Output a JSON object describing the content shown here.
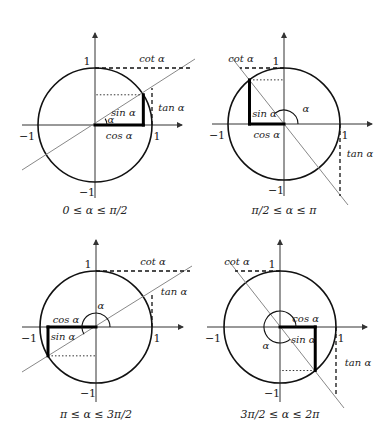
{
  "figure": {
    "labels": {
      "sin": "sin α",
      "cos": "cos α",
      "tan": "tan α",
      "cot": "cot α",
      "alpha": "α",
      "one": "1",
      "minus_one": "−1"
    },
    "panels": [
      {
        "id": "q1",
        "caption": "0 ≤ α ≤ π/2",
        "center": [
          95,
          125
        ],
        "radius": 57,
        "alpha_deg": 32,
        "arc_radius": 12,
        "axis": {
          "x_min": 22,
          "x_max": 182,
          "y_min": 33,
          "y_max": 198
        },
        "ray": [
          [
            22,
            170
          ],
          [
            195,
            59
          ]
        ],
        "cot_line": {
          "y": 68,
          "x_to": 190
        },
        "tan_line": {
          "x": 152,
          "y_to": 88
        },
        "caption_pos": [
          95,
          214
        ]
      },
      {
        "id": "q2",
        "caption": "π/2 ≤ α ≤ π",
        "center": [
          284,
          124
        ],
        "radius": 56,
        "alpha_deg": 128,
        "arc_radius": 14,
        "axis": {
          "x_min": 212,
          "x_max": 372,
          "y_min": 33,
          "y_max": 196
        },
        "ray": [
          [
            232,
            58
          ],
          [
            348,
            205
          ]
        ],
        "cot_line": {
          "y": 68,
          "x_to": 240
        },
        "tan_line": {
          "x": 340,
          "y_to": 196
        },
        "caption_pos": [
          284,
          214
        ]
      },
      {
        "id": "q3",
        "caption": "π ≤ α ≤ 3π/2",
        "center": [
          96,
          327
        ],
        "radius": 56,
        "alpha_deg": 211,
        "arc_radius": 14,
        "axis": {
          "x_min": 22,
          "x_max": 183,
          "y_min": 240,
          "y_max": 402
        },
        "ray": [
          [
            22,
            372
          ],
          [
            192,
            266
          ]
        ],
        "cot_line": {
          "y": 271,
          "x_to": 190
        },
        "tan_line": {
          "x": 152,
          "y_to": 293
        },
        "caption_pos": [
          96,
          418
        ]
      },
      {
        "id": "q4",
        "caption": "3π/2 ≤ α ≤ 2π",
        "center": [
          280,
          327
        ],
        "radius": 56,
        "alpha_deg": 309,
        "arc_radius": 16,
        "axis": {
          "x_min": 207,
          "x_max": 367,
          "y_min": 240,
          "y_max": 402
        },
        "ray": [
          [
            228,
            260
          ],
          [
            344,
            408
          ]
        ],
        "cot_line": {
          "y": 271,
          "x_to": 235
        },
        "tan_line": {
          "x": 336,
          "y_to": 397
        },
        "caption_pos": [
          280,
          418
        ]
      }
    ]
  }
}
